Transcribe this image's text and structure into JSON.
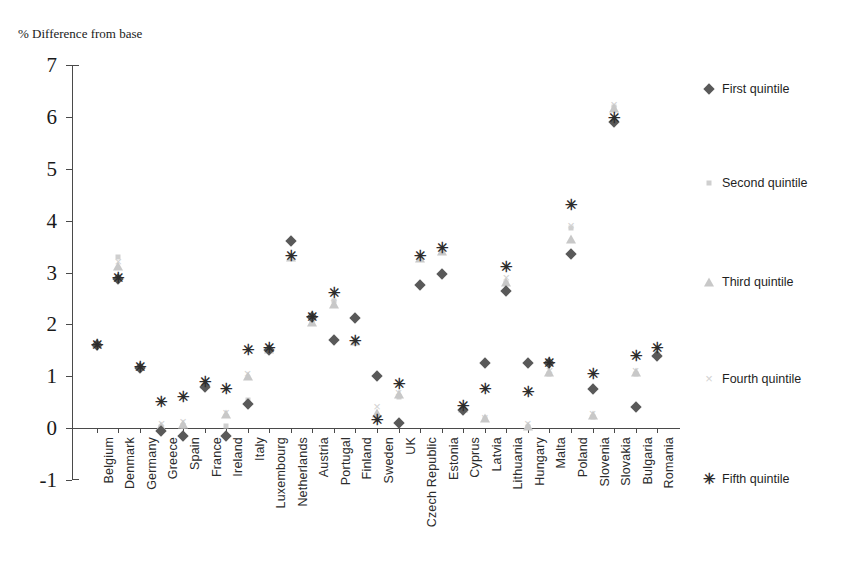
{
  "chart_data": {
    "type": "scatter",
    "title": "",
    "ylabel": "% Difference from base",
    "xlabel": "",
    "ylim": [
      -1,
      7
    ],
    "yticks": [
      7,
      6,
      5,
      4,
      3,
      2,
      1,
      0,
      -1
    ],
    "grid": false,
    "legend_position": "right",
    "categories": [
      "Belgium",
      "Denmark",
      "Germany",
      "Greece",
      "Spain",
      "France",
      "Ireland",
      "Italy",
      "Luxembourg",
      "Netherlands",
      "Austria",
      "Portugal",
      "Finland",
      "Sweden",
      "UK",
      "Czech Republic",
      "Estonia",
      "Cyprus",
      "Latvia",
      "Lithuania",
      "Hungary",
      "Malta",
      "Poland",
      "Slovenia",
      "Slovakia",
      "Bulgaria",
      "Romania"
    ],
    "series": [
      {
        "name": "First quintile",
        "marker": "diamond",
        "color": "#595959",
        "values": [
          1.6,
          2.88,
          1.15,
          -0.05,
          -0.15,
          0.8,
          -0.15,
          0.47,
          1.5,
          3.6,
          2.15,
          1.7,
          2.12,
          1.0,
          0.1,
          2.75,
          2.97,
          0.35,
          1.25,
          2.65,
          1.25,
          1.25,
          3.35,
          0.75,
          5.9,
          0.4,
          1.4
        ]
      },
      {
        "name": "Second quintile",
        "marker": "square",
        "color": "#cfcfcf",
        "values": [
          1.62,
          3.3,
          1.18,
          0.02,
          0.05,
          0.82,
          0.05,
          0.55,
          1.52,
          3.32,
          2.05,
          2.45,
          1.7,
          0.18,
          0.6,
          3.3,
          3.45,
          0.4,
          0.18,
          2.8,
          0.02,
          1.05,
          3.85,
          0.22,
          6.2,
          1.05,
          1.42
        ]
      },
      {
        "name": "Third quintile",
        "marker": "triangle",
        "color": "#c8c8c8",
        "values": [
          1.65,
          3.12,
          1.2,
          0.05,
          0.08,
          0.85,
          0.28,
          1.0,
          1.52,
          3.3,
          2.05,
          2.4,
          1.68,
          0.3,
          0.65,
          3.28,
          3.42,
          0.38,
          0.2,
          2.82,
          0.05,
          1.08,
          3.65,
          0.25,
          6.18,
          1.08,
          1.45
        ]
      },
      {
        "name": "Fourth quintile",
        "marker": "cross",
        "color": "#d2d2d2",
        "values": [
          1.63,
          3.2,
          1.18,
          0.08,
          0.12,
          0.88,
          0.3,
          1.05,
          1.55,
          3.3,
          2.08,
          2.42,
          1.7,
          0.4,
          0.68,
          3.3,
          3.45,
          0.42,
          0.2,
          2.9,
          0.08,
          1.1,
          3.9,
          0.28,
          6.22,
          1.1,
          1.48
        ]
      },
      {
        "name": "Fifth quintile",
        "marker": "star",
        "color": "#2c2c2c",
        "values": [
          1.6,
          2.9,
          1.18,
          0.5,
          0.6,
          0.88,
          0.75,
          1.5,
          1.55,
          3.32,
          2.15,
          2.6,
          1.68,
          0.15,
          0.85,
          3.32,
          3.47,
          0.42,
          0.75,
          3.1,
          0.7,
          1.25,
          4.3,
          1.05,
          5.98,
          1.4,
          1.55
        ]
      }
    ]
  }
}
